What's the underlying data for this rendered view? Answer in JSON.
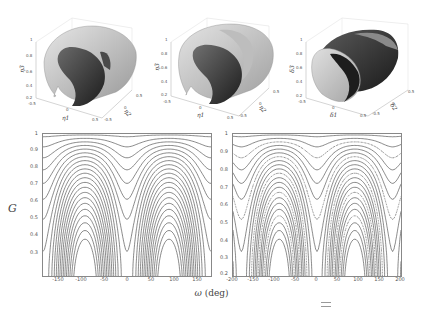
{
  "figure": {
    "top_row": [
      {
        "id": "surface-a",
        "x_label": "η1",
        "y_label": "η2",
        "z_label": "η3",
        "x_ticks": [
          "-0.5",
          "0",
          "0.5"
        ],
        "y_ticks": [
          "0.5",
          "0",
          "-0.5"
        ],
        "z_ticks": [
          "1",
          "0.8",
          "0.6",
          "0.4",
          "0.2"
        ]
      },
      {
        "id": "surface-b",
        "x_label": "η1",
        "y_label": "η2",
        "z_label": "η3",
        "x_ticks": [
          "-0.5",
          "0",
          "0.5"
        ],
        "y_ticks": [
          "0.5",
          "0",
          "-0.5"
        ],
        "z_ticks": [
          "1",
          "0.8",
          "0.6",
          "0.4",
          "0.2"
        ]
      },
      {
        "id": "surface-c",
        "x_label": "δ1",
        "y_label": "δ2",
        "z_label": "δ3",
        "x_ticks": [
          "-0.5",
          "0",
          "0.5"
        ],
        "y_ticks": [
          "0.5",
          "0",
          "-0.5"
        ],
        "z_ticks": [
          "1",
          "0.8",
          "0.6",
          "0.4",
          "0.2"
        ]
      }
    ],
    "y_axis_label": "G",
    "x_axis_label_symbol": "ω",
    "x_axis_label_unit": "(deg)",
    "colors": {
      "contour_line": "#3a3a3a",
      "frame": "#888888",
      "surface_light": "#cfcfcf",
      "surface_dark": "#2a2a2a"
    }
  },
  "chart_data": [
    {
      "type": "contour",
      "title": "",
      "xlabel": "ω (deg)",
      "ylabel": "G",
      "xlim": [
        -180,
        180
      ],
      "ylim": [
        0.2,
        1
      ],
      "x_ticks": [
        "-150",
        "-100",
        "-50",
        "0",
        "50",
        "100",
        "150"
      ],
      "y_ticks": [
        "1",
        "0.9",
        "0.8",
        "0.7",
        "0.6",
        "0.5",
        "0.4",
        "0.3"
      ],
      "features": {
        "closed_islands_centers_deg": [
          -90,
          90
        ],
        "island_G_range": [
          0.48,
          0.93
        ],
        "saddle_at_deg": 0,
        "lobe_peaks_deg": [
          -90,
          90
        ],
        "dense_contours_near_G": 0.2
      },
      "grid": false
    },
    {
      "type": "contour",
      "title": "",
      "xlabel": "ω (deg)",
      "ylabel": "G",
      "xlim": [
        -200,
        200
      ],
      "ylim": [
        0.2,
        1
      ],
      "x_ticks": [
        "-200",
        "-150",
        "-100",
        "-50",
        "0",
        "50",
        "100",
        "150",
        "200"
      ],
      "y_ticks": [
        "1",
        "0.9",
        "0.8",
        "0.7",
        "0.6",
        "0.5",
        "0.4",
        "0.3",
        "0.2"
      ],
      "features": {
        "closed_islands_centers_deg": [
          -90,
          90
        ],
        "island_G_range": [
          0.45,
          0.93
        ],
        "island_center_G": 0.66,
        "saddle_at_deg": 0,
        "dotted_separatrix": true,
        "dense_contours_near_G": 0.2
      },
      "grid": false
    }
  ]
}
